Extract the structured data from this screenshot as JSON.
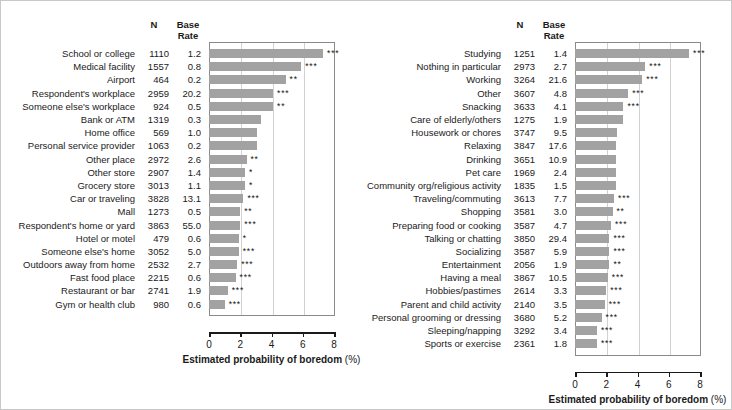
{
  "figure": {
    "bar_color": "#a2a2a2",
    "grid_color": "#d2d2d2",
    "frame_color": "#8a8a8a"
  },
  "columns": {
    "n_header": "N",
    "base_rate_header_line1": "Base",
    "base_rate_header_line2": "Rate"
  },
  "chart_data": [
    {
      "type": "bar",
      "panel": "left",
      "title": "",
      "xlabel": "Estimated probability of boredom (%)",
      "xlabel_suffix": "(%)",
      "ylabel": "",
      "xlim": [
        0,
        8
      ],
      "xticks": [
        0,
        2,
        4,
        6,
        8
      ],
      "xticklabels": [
        "0",
        "2",
        "4",
        "6",
        "8"
      ],
      "grid": true,
      "legend": "none",
      "orientation": "horizontal",
      "categories": [
        "School or college",
        "Medical facility",
        "Airport",
        "Respondent's workplace",
        "Someone else's workplace",
        "Bank or ATM",
        "Home office",
        "Personal service provider",
        "Other place",
        "Other store",
        "Grocery store",
        "Car or traveling",
        "Mall",
        "Respondent's home or yard",
        "Hotel or motel",
        "Someone else's home",
        "Outdoors away from home",
        "Fast food place",
        "Restaurant or bar",
        "Gym or health club"
      ],
      "n": [
        1110,
        1557,
        464,
        2959,
        924,
        1319,
        569,
        1063,
        2972,
        2907,
        3013,
        3828,
        1273,
        3863,
        479,
        3052,
        2532,
        2215,
        2741,
        980
      ],
      "base_rate": [
        1.2,
        0.8,
        0.2,
        20.2,
        0.5,
        0.3,
        1.0,
        0.2,
        2.6,
        1.4,
        1.1,
        13.1,
        0.5,
        55.0,
        0.6,
        5.0,
        2.7,
        0.6,
        1.9,
        0.6
      ],
      "values": [
        7.3,
        5.9,
        4.9,
        4.1,
        4.1,
        3.3,
        3.1,
        3.1,
        2.4,
        2.3,
        2.3,
        2.2,
        2.0,
        2.0,
        1.9,
        1.9,
        1.8,
        1.7,
        1.2,
        1.0
      ],
      "significance": [
        "***",
        "***",
        "**",
        "***",
        "**",
        "",
        "",
        "",
        "**",
        "*",
        "*",
        "***",
        "**",
        "***",
        "*",
        "***",
        "***",
        "***",
        "***",
        "***"
      ]
    },
    {
      "type": "bar",
      "panel": "right",
      "title": "",
      "xlabel": "Estimated probability of boredom (%)",
      "xlabel_suffix": "(%)",
      "ylabel": "",
      "xlim": [
        0,
        8
      ],
      "xticks": [
        0,
        2,
        4,
        6,
        8
      ],
      "xticklabels": [
        "0",
        "2",
        "4",
        "6",
        "8"
      ],
      "grid": true,
      "legend": "none",
      "orientation": "horizontal",
      "categories": [
        "Studying",
        "Nothing in particular",
        "Working",
        "Other",
        "Snacking",
        "Care of elderly/others",
        "Housework or chores",
        "Relaxing",
        "Drinking",
        "Pet care",
        "Community org/religious activity",
        "Traveling/commuting",
        "Shopping",
        "Preparing food or cooking",
        "Talking or chatting",
        "Socializing",
        "Entertainment",
        "Having a meal",
        "Hobbies/pastimes",
        "Parent and child activity",
        "Personal grooming or dressing",
        "Sleeping/napping",
        "Sports or exercise"
      ],
      "n": [
        1251,
        2973,
        3264,
        3607,
        3633,
        1275,
        3747,
        3847,
        3651,
        1969,
        1835,
        3613,
        3581,
        3587,
        3850,
        3587,
        2056,
        3867,
        2614,
        2140,
        3680,
        3292,
        2361
      ],
      "base_rate": [
        1.4,
        2.7,
        21.6,
        4.8,
        4.1,
        1.9,
        9.5,
        17.6,
        10.9,
        2.4,
        1.5,
        7.7,
        3.0,
        4.7,
        29.4,
        5.9,
        1.9,
        10.5,
        3.3,
        3.5,
        5.2,
        3.4,
        1.8
      ],
      "values": [
        7.3,
        4.5,
        4.3,
        3.4,
        3.1,
        3.1,
        2.7,
        2.6,
        2.6,
        2.6,
        2.6,
        2.5,
        2.4,
        2.3,
        2.2,
        2.2,
        2.2,
        2.1,
        2.0,
        1.9,
        1.7,
        1.4,
        1.4
      ],
      "significance": [
        "***",
        "***",
        "***",
        "***",
        "***",
        "",
        "",
        "",
        "",
        "",
        "",
        "***",
        "**",
        "***",
        "***",
        "***",
        "**",
        "***",
        "***",
        "***",
        "***",
        "***",
        "***"
      ]
    }
  ]
}
